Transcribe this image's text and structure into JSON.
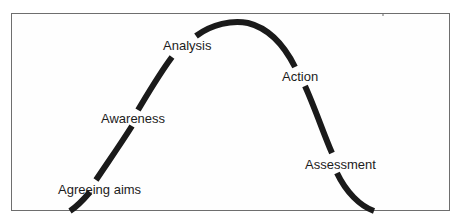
{
  "diagram": {
    "type": "bell-curve-process",
    "stroke_color": "#1a1a1a",
    "frame_color": "#6e6e6e",
    "stages": [
      {
        "id": "agreeing-aims",
        "label": "Agreeing aims"
      },
      {
        "id": "awareness",
        "label": "Awareness"
      },
      {
        "id": "analysis",
        "label": "Analysis"
      },
      {
        "id": "action",
        "label": "Action"
      },
      {
        "id": "assessment",
        "label": "Assessment"
      }
    ]
  }
}
